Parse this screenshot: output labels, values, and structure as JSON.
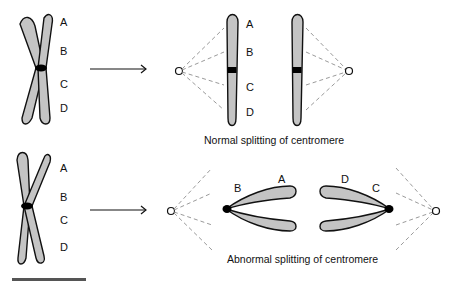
{
  "diagram": {
    "topic": "Centromere splitting during cell division",
    "row1": {
      "labels": [
        "A",
        "B",
        "C",
        "D"
      ],
      "daughter_labels": [
        "A",
        "B",
        "C",
        "D"
      ],
      "caption": "Normal splitting of centromere"
    },
    "row2": {
      "labels": [
        "A",
        "B",
        "C",
        "D"
      ],
      "left_arm_labels": [
        "B",
        "A"
      ],
      "right_arm_labels": [
        "D",
        "C"
      ],
      "caption": "Abnormal splitting of centromere"
    },
    "colors": {
      "chromatid_fill": "#c4c4c4",
      "outline": "#111111",
      "centromere": "#000000",
      "spindle_lines": "#9a9a9a",
      "scale_bar": "#555555"
    }
  }
}
